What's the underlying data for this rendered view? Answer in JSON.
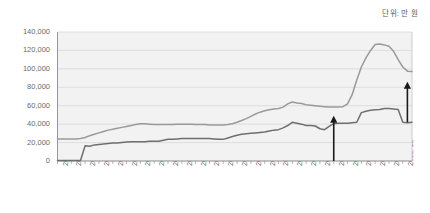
{
  "unit_note": "단위: 만 원",
  "chart_data": {
    "type": "line",
    "title": "",
    "subtitle": "",
    "xlabel": "",
    "ylabel": "",
    "unit_note": "단위: 만 원",
    "grid": true,
    "legend": "none",
    "ylim": [
      0,
      140000
    ],
    "ytick_labels": [
      "140,000",
      "120,000",
      "100,000",
      "80,000",
      "60,000",
      "40,000",
      "20,000",
      "0"
    ],
    "ytick_values": [
      140000,
      120000,
      100000,
      80000,
      60000,
      40000,
      20000,
      0
    ],
    "xtick_labels": [
      "2004-03",
      "2004-12",
      "2005-09",
      "2006-06",
      "2007-03",
      "2007-12",
      "2008-09",
      "2009-06",
      "2010-03",
      "2010-12",
      "2011-09",
      "2012-06",
      "2013-03",
      "2013-12",
      "2014-09",
      "2015-06",
      "2016-03",
      "2016-12",
      "2017-09",
      "2018-06",
      "2019-03",
      "2019-12",
      "2020-09",
      "2021-06",
      "2022-03",
      "2022-12"
    ],
    "x_start": "2004-03",
    "x_end": "2023-06",
    "x_step_months": 3,
    "series": [
      {
        "name": "upper-line",
        "color": "#9a9a9a",
        "x": [
          "2004-03",
          "2004-06",
          "2004-09",
          "2004-12",
          "2005-03",
          "2005-06",
          "2005-09",
          "2005-12",
          "2006-03",
          "2006-06",
          "2006-09",
          "2006-12",
          "2007-03",
          "2007-06",
          "2007-09",
          "2007-12",
          "2008-03",
          "2008-06",
          "2008-09",
          "2008-12",
          "2009-03",
          "2009-06",
          "2009-09",
          "2009-12",
          "2010-03",
          "2010-06",
          "2010-09",
          "2010-12",
          "2011-03",
          "2011-06",
          "2011-09",
          "2011-12",
          "2012-03",
          "2012-06",
          "2012-09",
          "2012-12",
          "2013-03",
          "2013-06",
          "2013-09",
          "2013-12",
          "2014-03",
          "2014-06",
          "2014-09",
          "2014-12",
          "2015-03",
          "2015-06",
          "2015-09",
          "2015-12",
          "2016-03",
          "2016-06",
          "2016-09",
          "2016-12",
          "2017-03",
          "2017-06",
          "2017-09",
          "2017-12",
          "2018-03",
          "2018-06",
          "2018-09",
          "2018-12",
          "2019-03",
          "2019-06",
          "2019-09",
          "2019-12",
          "2020-03",
          "2020-06",
          "2020-09",
          "2020-12",
          "2021-03",
          "2021-06",
          "2021-09",
          "2021-12",
          "2022-03",
          "2022-06",
          "2022-09",
          "2022-12",
          "2023-03",
          "2023-06"
        ],
        "values": [
          24000,
          24000,
          24000,
          24000,
          24000,
          24500,
          25500,
          27500,
          29000,
          30500,
          32000,
          33500,
          34500,
          35500,
          36500,
          37500,
          38500,
          39500,
          40500,
          40500,
          40000,
          39500,
          39500,
          39500,
          39500,
          39500,
          40000,
          40000,
          40000,
          40000,
          39500,
          39500,
          39500,
          39000,
          39000,
          39000,
          39000,
          39500,
          40500,
          42000,
          44000,
          46000,
          48500,
          51000,
          53000,
          54500,
          55500,
          56500,
          57000,
          58500,
          62000,
          64000,
          63000,
          62500,
          61000,
          60500,
          60000,
          59500,
          59000,
          58500,
          58500,
          58500,
          59000,
          62000,
          72000,
          88000,
          102000,
          112000,
          120000,
          126500,
          127000,
          126000,
          124500,
          119000,
          110000,
          102000,
          97500,
          97000
        ]
      },
      {
        "name": "lower-line",
        "color": "#6f6f6f",
        "x": [
          "2004-03",
          "2004-06",
          "2004-09",
          "2004-12",
          "2005-03",
          "2005-06",
          "2005-09",
          "2005-12",
          "2006-03",
          "2006-06",
          "2006-09",
          "2006-12",
          "2007-03",
          "2007-06",
          "2007-09",
          "2007-12",
          "2008-03",
          "2008-06",
          "2008-09",
          "2008-12",
          "2009-03",
          "2009-06",
          "2009-09",
          "2009-12",
          "2010-03",
          "2010-06",
          "2010-09",
          "2010-12",
          "2011-03",
          "2011-06",
          "2011-09",
          "2011-12",
          "2012-03",
          "2012-06",
          "2012-09",
          "2012-12",
          "2013-03",
          "2013-06",
          "2013-09",
          "2013-12",
          "2014-03",
          "2014-06",
          "2014-09",
          "2014-12",
          "2015-03",
          "2015-06",
          "2015-09",
          "2015-12",
          "2016-03",
          "2016-06",
          "2016-09",
          "2016-12",
          "2017-03",
          "2017-06",
          "2017-09",
          "2017-12",
          "2018-03",
          "2018-06",
          "2018-09",
          "2018-12",
          "2019-03",
          "2019-06",
          "2019-09",
          "2019-12",
          "2020-03",
          "2020-06",
          "2020-09",
          "2020-12",
          "2021-03",
          "2021-06",
          "2021-09",
          "2021-12",
          "2022-03",
          "2022-06",
          "2022-09",
          "2022-12",
          "2023-03",
          "2023-06"
        ],
        "values": [
          500,
          500,
          500,
          500,
          500,
          500,
          16500,
          16000,
          17500,
          18000,
          18500,
          19000,
          19500,
          19500,
          20000,
          20500,
          21000,
          21000,
          21000,
          21000,
          21500,
          21500,
          21500,
          22500,
          23500,
          23500,
          24000,
          24500,
          24500,
          24500,
          24500,
          24500,
          24500,
          24500,
          24000,
          23500,
          23500,
          25000,
          26500,
          28000,
          29000,
          29500,
          30000,
          30500,
          31000,
          31500,
          32500,
          33500,
          34000,
          36000,
          38500,
          42000,
          41000,
          40000,
          38500,
          38500,
          38000,
          35000,
          34000,
          37500,
          40500,
          41000,
          41000,
          41000,
          41500,
          42000,
          52500,
          54000,
          55000,
          55500,
          56000,
          57000,
          57000,
          56500,
          56000,
          42000,
          41500,
          42000
        ]
      }
    ],
    "annotations": [
      {
        "name": "arrow-2019",
        "type": "up-arrow",
        "x": "2019-03",
        "y_from": 0,
        "y_to": 49000,
        "color": "#1a1a1a"
      },
      {
        "name": "arrow-2023",
        "type": "up-arrow",
        "x": "2023-03",
        "y_from": 42000,
        "y_to": 86000,
        "color": "#1a1a1a"
      }
    ]
  }
}
